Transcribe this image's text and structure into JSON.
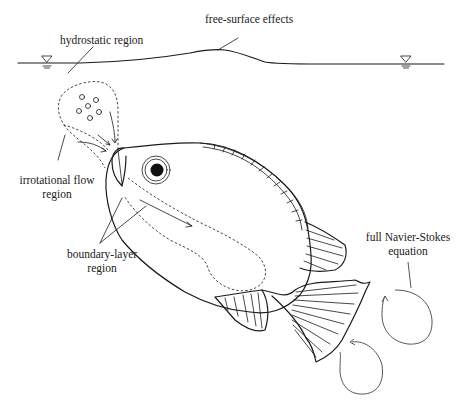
{
  "diagram": {
    "type": "annotated illustration",
    "labels": {
      "hydrostatic": "hydrostatic region",
      "free_surface": "free-surface effects",
      "irrotational_line1": "irrotational flow",
      "irrotational_line2": "region",
      "boundary_line1": "boundary-layer",
      "boundary_line2": "region",
      "navier_line1": "full Navier-Stokes",
      "navier_line2": "equation"
    },
    "symbols": {
      "water_level_marker": "inverted-triangle-icon",
      "count": 2
    },
    "colors": {
      "ink": "#1a1a1a",
      "background": "#ffffff",
      "vortex": "#555555"
    }
  }
}
